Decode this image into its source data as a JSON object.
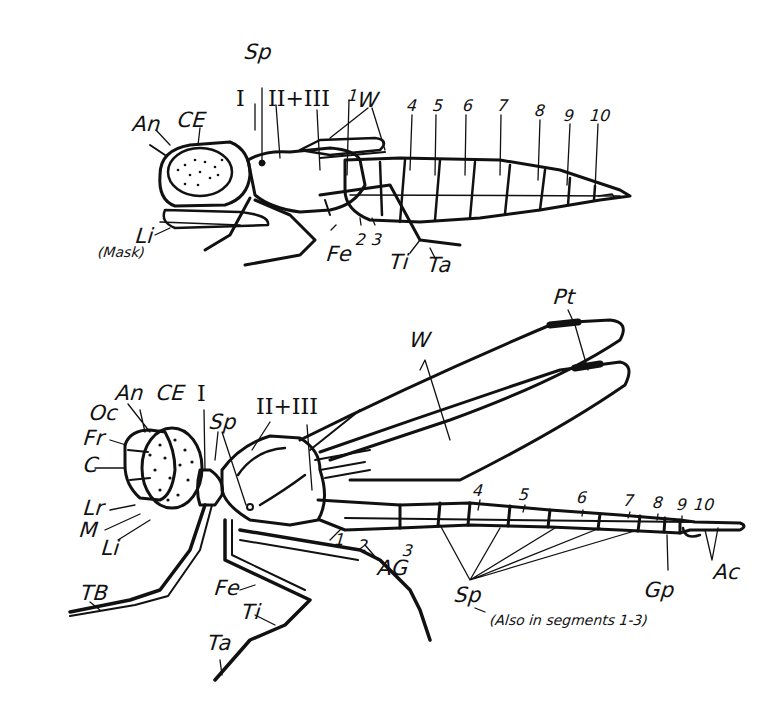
{
  "figure": {
    "colors": {
      "ink": "#111111",
      "background": "#ffffff"
    }
  },
  "larva": {
    "labels": {
      "sp": "Sp",
      "seg_I": "I",
      "seg_II_III": "II+III",
      "an": "An",
      "ce": "CE",
      "w": "W",
      "li": "Li",
      "mask": "(Mask)",
      "fe": "Fe",
      "ti": "Ti",
      "ta": "Ta",
      "n1": "1",
      "n2": "2",
      "n3": "3",
      "n4": "4",
      "n5": "5",
      "n6": "6",
      "n7": "7",
      "n8": "8",
      "n9": "9",
      "n10": "10"
    }
  },
  "adult": {
    "labels": {
      "pt": "Pt",
      "w": "W",
      "an": "An",
      "ce": "CE",
      "oc": "Oc",
      "fr": "Fr",
      "c": "C",
      "lr": "Lr",
      "m": "M",
      "li": "Li",
      "seg_I": "I",
      "seg_II_III": "II+III",
      "sp": "Sp",
      "tb": "TB",
      "fe": "Fe",
      "ti": "Ti",
      "ta": "Ta",
      "ag": "AG",
      "n1": "1",
      "n2": "2",
      "n3": "3",
      "n4": "4",
      "n5": "5",
      "n6": "6",
      "n7": "7",
      "n8": "8",
      "n9": "9",
      "n10": "10",
      "sp_bottom": "Sp",
      "sp_note": "(Also in segments 1-3)",
      "gp": "Gp",
      "ac": "Ac"
    }
  }
}
